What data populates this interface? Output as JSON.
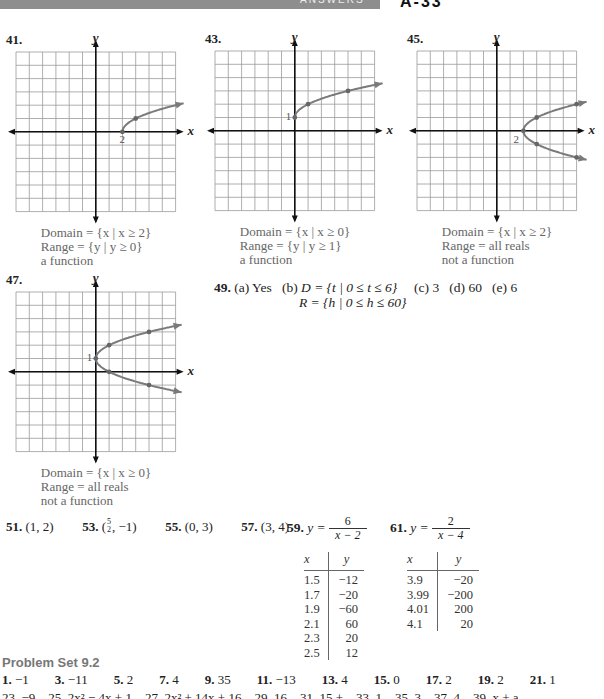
{
  "header": {
    "section_label": "ANSWERS",
    "page_number": "A-33"
  },
  "graphs": [
    {
      "number": "41.",
      "axis_x": "x",
      "axis_y": "y",
      "point_label": "2",
      "caption": [
        "Domain = {x | x ≥ 2}",
        "Range = {y | y ≥ 0}",
        "a function"
      ]
    },
    {
      "number": "43.",
      "axis_x": "x",
      "axis_y": "y",
      "point_label": "1",
      "caption": [
        "Domain = {x | x ≥ 0}",
        "Range = {y | y ≥ 1}",
        "a function"
      ]
    },
    {
      "number": "45.",
      "axis_x": "x",
      "axis_y": "y",
      "point_label": "2",
      "caption": [
        "Domain = {x | x ≥ 2}",
        "Range = all reals",
        "not a function"
      ]
    },
    {
      "number": "47.",
      "axis_x": "x",
      "axis_y": "y",
      "point_label": "1",
      "caption": [
        "Domain = {x | x ≥ 0}",
        "Range = all reals",
        "not a function"
      ]
    }
  ],
  "chart_data": [
    {
      "type": "line",
      "title": "41.",
      "xlabel": "x",
      "ylabel": "y",
      "xlim": [
        -6,
        6
      ],
      "ylim": [
        -6,
        6
      ],
      "grid": true,
      "points": [
        [
          2,
          0
        ],
        [
          3,
          1
        ]
      ],
      "curve": "y = sqrt(x - 2)"
    },
    {
      "type": "line",
      "title": "43.",
      "xlabel": "x",
      "ylabel": "y",
      "xlim": [
        -6,
        6
      ],
      "ylim": [
        -6,
        6
      ],
      "grid": true,
      "points": [
        [
          0,
          1
        ],
        [
          1,
          2
        ],
        [
          4,
          3
        ]
      ],
      "curve": "y = sqrt(x) + 1"
    },
    {
      "type": "line",
      "title": "45.",
      "xlabel": "x",
      "ylabel": "y",
      "xlim": [
        -6,
        6
      ],
      "ylim": [
        -6,
        6
      ],
      "grid": true,
      "points": [
        [
          2,
          0
        ],
        [
          3,
          1
        ],
        [
          3,
          -1
        ],
        [
          6,
          2
        ],
        [
          6,
          -2
        ]
      ],
      "curve": "x = y^2 + 2"
    },
    {
      "type": "line",
      "title": "47.",
      "xlabel": "x",
      "ylabel": "y",
      "xlim": [
        -6,
        6
      ],
      "ylim": [
        -6,
        6
      ],
      "grid": true,
      "points": [
        [
          0,
          1
        ],
        [
          1,
          2
        ],
        [
          1,
          0
        ],
        [
          4,
          3
        ],
        [
          4,
          -1
        ]
      ],
      "curve": "x = (y - 1)^2"
    }
  ],
  "answer49": {
    "number": "49.",
    "a": "(a) Yes",
    "b_label": "(b)",
    "b_domain": "D = {t | 0 ≤ t ≤ 6}",
    "b_range": "R = {h | 0 ≤ h ≤ 60}",
    "c": "(c) 3",
    "d": "(d) 60",
    "e": "(e) 6"
  },
  "points_row": [
    {
      "number": "51.",
      "answer": "(1, 2)"
    },
    {
      "number": "53.",
      "answer_pre": "(",
      "frac_num": "5",
      "frac_den": "2",
      "answer_post": ", −1)"
    },
    {
      "number": "55.",
      "answer": "(0, 3)"
    },
    {
      "number": "57.",
      "answer": "(3, 4)"
    }
  ],
  "table59": {
    "number": "59.",
    "lhs": "y =",
    "numerator": "6",
    "denominator": "x − 2",
    "headers": [
      "x",
      "y"
    ],
    "rows": [
      [
        "1.5",
        "−12"
      ],
      [
        "1.7",
        "−20"
      ],
      [
        "1.9",
        "−60"
      ],
      [
        "2.1",
        "60"
      ],
      [
        "2.3",
        "20"
      ],
      [
        "2.5",
        "12"
      ]
    ]
  },
  "table61": {
    "number": "61.",
    "lhs": "y =",
    "numerator": "2",
    "denominator": "x − 4",
    "headers": [
      "x",
      "y"
    ],
    "rows": [
      [
        "3.9",
        "−20"
      ],
      [
        "3.99",
        "−200"
      ],
      [
        "4.01",
        "200"
      ],
      [
        "4.1",
        "20"
      ]
    ]
  },
  "problem_set": {
    "title": "Problem Set 9.2",
    "row1": [
      {
        "n": "1.",
        "a": "−1"
      },
      {
        "n": "3.",
        "a": "−11"
      },
      {
        "n": "5.",
        "a": "2"
      },
      {
        "n": "7.",
        "a": "4"
      },
      {
        "n": "9.",
        "a": "35"
      },
      {
        "n": "11.",
        "a": "−13"
      },
      {
        "n": "13.",
        "a": "4"
      },
      {
        "n": "15.",
        "a": "0"
      },
      {
        "n": "17.",
        "a": "2"
      },
      {
        "n": "19.",
        "a": "2"
      },
      {
        "n": "21.",
        "a": "1"
      }
    ],
    "row2_partial": "23. −9    25. 2x² − 4x + 1    27. 2x² + 14x + 16    29. 16    31. 15 +    33. 1    35. 3    37. 4    39. x + a"
  }
}
